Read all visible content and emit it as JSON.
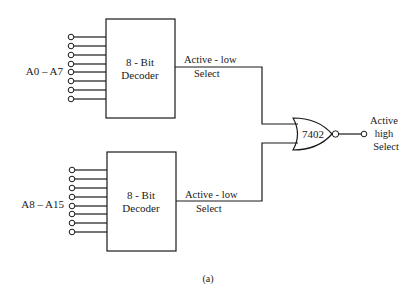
{
  "diagram": {
    "type": "logic-circuit",
    "caption": "(a)",
    "decoders": [
      {
        "id": "top",
        "label_line1": "8 - Bit",
        "label_line2": "Decoder",
        "input_label": "A0 – A7",
        "input_count": 8,
        "output_label_line1": "Active - low",
        "output_label_line2": "Select"
      },
      {
        "id": "bottom",
        "label_line1": "8 - Bit",
        "label_line2": "Decoder",
        "input_label": "A8 – A15",
        "input_count": 8,
        "output_label_line1": "Active - low",
        "output_label_line2": "Select"
      }
    ],
    "gate": {
      "type": "NOR",
      "label": "7402"
    },
    "output": {
      "label_line1": "Active",
      "label_line2": "high",
      "label_line3": "Select"
    }
  }
}
